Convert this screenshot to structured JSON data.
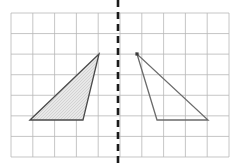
{
  "figure": {
    "canvas": {
      "width": 234,
      "height": 166,
      "background": "#ffffff"
    },
    "grid": {
      "name": "square-grid",
      "origin_x": 11,
      "origin_y": 13,
      "cell_width": 21.8,
      "cell_height": 20.57,
      "columns": 10,
      "rows": 7,
      "line_color": "#b8b8b8",
      "line_width": 0.8,
      "right_edge": 229,
      "bottom_edge": 157
    },
    "mirror_line": {
      "name": "line-of-reflection",
      "orientation": "vertical",
      "x": 118,
      "y_start": 0,
      "y_end": 166,
      "style": "dashed",
      "color": "#1a1a1a",
      "line_width": 2.6,
      "dash_on": 7,
      "dash_off": 5
    },
    "shapes": [
      {
        "name": "left-triangle-shaded",
        "label": "pre-image",
        "points": "30,120 99,54 83,120",
        "vertices": [
          [
            30,
            120
          ],
          [
            99,
            54
          ],
          [
            83,
            120
          ]
        ],
        "fill": "#e3e3e3",
        "fill_pattern": "stipple-hatch",
        "stroke": "#4a4a4a",
        "stroke_width": 1.3,
        "shaded": true
      },
      {
        "name": "right-triangle-unshaded",
        "label": "image",
        "points": "137,54 157,120 208,120",
        "vertices": [
          [
            137,
            54
          ],
          [
            157,
            120
          ],
          [
            208,
            120
          ]
        ],
        "fill": "none",
        "fill_pattern": "none",
        "stroke": "#6b6b6b",
        "stroke_width": 1.3,
        "shaded": false
      }
    ],
    "vertex_marker": {
      "name": "right-triangle-apex-marker",
      "x": 137,
      "y": 54,
      "size": 3.2,
      "color": "#3a3a3a"
    }
  }
}
